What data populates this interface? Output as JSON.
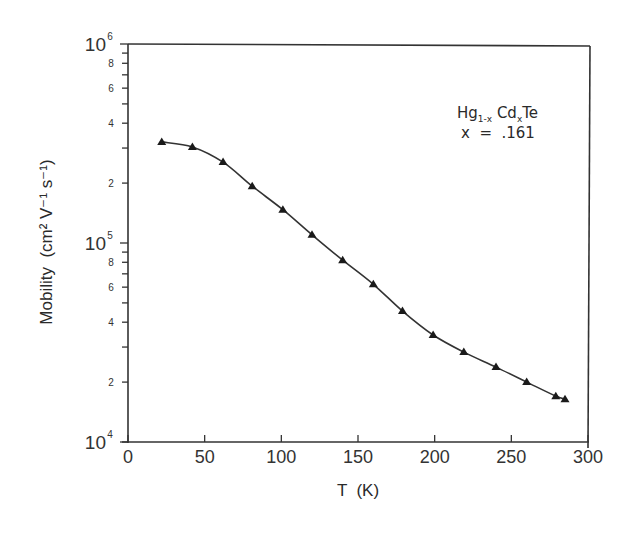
{
  "chart_data": {
    "type": "line",
    "title": "",
    "xlabel": "T  (K)",
    "ylabel": "Mobility  (cm² V⁻¹ s⁻¹)",
    "xlim": [
      0,
      300
    ],
    "ylim": [
      10000,
      1000000
    ],
    "yscale": "log",
    "grid": false,
    "x_ticks": [
      0,
      50,
      100,
      150,
      200,
      250,
      300
    ],
    "y_major_ticks": [
      {
        "value": 10000,
        "label": "10",
        "exp": "4"
      },
      {
        "value": 100000,
        "label": "10",
        "exp": "5"
      },
      {
        "value": 1000000,
        "label": "10",
        "exp": "6"
      }
    ],
    "y_minor_labels": [
      "2",
      "4",
      "6",
      "8"
    ],
    "annotation": {
      "formula_base": "Hg",
      "formula_sub1": "1-x",
      "formula_mid": " Cd",
      "formula_sub2": "x",
      "formula_end": "Te",
      "composition": "x  =  .161"
    },
    "series": [
      {
        "name": "Hg1-xCdxTe x=.161",
        "marker": "triangle",
        "x": [
          22,
          42,
          62,
          81,
          101,
          120,
          140,
          160,
          179,
          199,
          219,
          240,
          260,
          279,
          285
        ],
        "y": [
          322000,
          304000,
          255000,
          193000,
          147000,
          110000,
          82000,
          62000,
          45500,
          34500,
          28300,
          23800,
          20000,
          17000,
          16400
        ]
      }
    ]
  }
}
